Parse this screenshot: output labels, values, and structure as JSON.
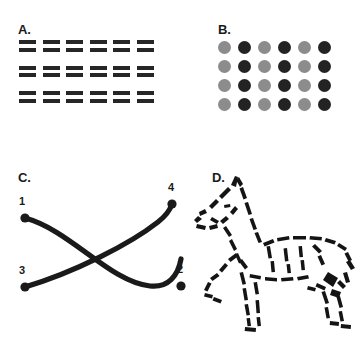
{
  "figure": {
    "background_color": "#ffffff",
    "width": 361,
    "height": 337
  },
  "panels": {
    "a": {
      "label": "A.",
      "name": "proximity-dashes",
      "dash_color": "#262626",
      "groups": 3,
      "rows_per_group": 2,
      "dashes_per_row": 6,
      "dash_width_px": 17,
      "dash_height_px": 4
    },
    "b": {
      "label": "B.",
      "name": "similarity-dots",
      "columns": 6,
      "rows": 4,
      "dot_diameter_px": 13,
      "colors": {
        "light": "#8c8c8c",
        "dark": "#232323"
      },
      "pattern": [
        [
          "light",
          "dark",
          "light",
          "dark",
          "light",
          "dark"
        ],
        [
          "light",
          "dark",
          "light",
          "dark",
          "light",
          "dark"
        ],
        [
          "light",
          "dark",
          "light",
          "dark",
          "light",
          "dark"
        ],
        [
          "light",
          "dark",
          "light",
          "dark",
          "light",
          "dark"
        ]
      ]
    },
    "c": {
      "label": "C.",
      "name": "good-continuation-curves",
      "stroke_color": "#1a1a1a",
      "stroke_width_px": 5.2,
      "endpoints": [
        {
          "id": "1",
          "label": "1",
          "x": 25,
          "y": 58,
          "label_x": 19,
          "label_y": 36
        },
        {
          "id": "2",
          "label": "2",
          "x": 181,
          "y": 126,
          "label_x": 177,
          "label_y": 104
        },
        {
          "id": "3",
          "label": "3",
          "x": 25,
          "y": 127,
          "label_x": 19,
          "label_y": 105
        },
        {
          "id": "4",
          "label": "4",
          "x": 172,
          "y": 44,
          "label_x": 168,
          "label_y": 22
        }
      ],
      "curves": [
        {
          "from": "1",
          "to": "2",
          "path": "M 25 58 C 70 70 110 122 150 126 C 168 128 178 116 181 99"
        },
        {
          "from": "3",
          "to": "4",
          "path": "M 25 127 C 75 112 130 84 158 62 C 167 55 170 50 172 44"
        }
      ]
    },
    "d": {
      "label": "D.",
      "name": "closure-fragmented-animal",
      "subject": "horse",
      "stroke_color": "#141414",
      "style": "fragmented brush strokes forming illusory contour"
    }
  }
}
